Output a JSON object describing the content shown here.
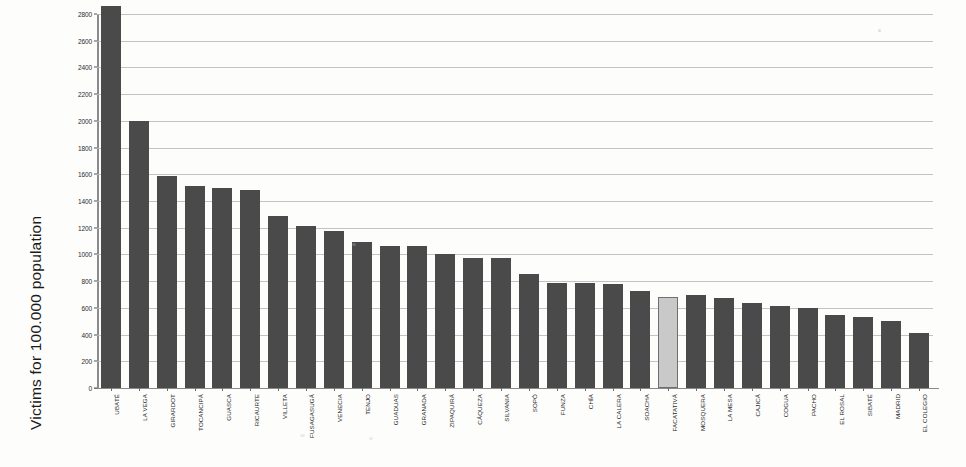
{
  "chart_data": {
    "type": "bar",
    "title": "",
    "subtitle": "",
    "xlabel": "",
    "ylabel": "Victims for 100.000 population",
    "ylim": [
      0,
      2800
    ],
    "ytick_step": 200,
    "yticks": [
      0,
      200,
      400,
      600,
      800,
      1000,
      1200,
      1400,
      1600,
      1800,
      2000,
      2200,
      2400,
      2600,
      2800
    ],
    "grid": true,
    "legend": "none",
    "orientation": "vertical",
    "bar_color": "#4a4a4a",
    "highlight_color": "#c9c9c9",
    "highlight_category": "FACATATIVÁ",
    "categories": [
      "UBATÉ",
      "LA VEGA",
      "GIRARDOT",
      "TOCANCIPÁ",
      "GUASCA",
      "RICAURTE",
      "VILLETA",
      "FUSAGASUGÁ",
      "VENECIA",
      "TENJO",
      "GUADUAS",
      "GRANADA",
      "ZIPAQUIRÁ",
      "CÁQUEZA",
      "SILVANIA",
      "SOPÓ",
      "FUNZA",
      "CHÍA",
      "LA CALERA",
      "SOACHA",
      "FACATATIVÁ",
      "MOSQUERA",
      "LA MESA",
      "CAJICÁ",
      "COGUA",
      "PACHO",
      "EL ROSAL",
      "SIBATÉ",
      "MADRID",
      "EL COLEGIO"
    ],
    "values": [
      2860,
      2000,
      1590,
      1510,
      1495,
      1480,
      1290,
      1215,
      1175,
      1095,
      1060,
      1060,
      1000,
      975,
      975,
      855,
      785,
      785,
      775,
      730,
      680,
      700,
      675,
      640,
      615,
      600,
      545,
      535,
      500,
      410
    ],
    "units": "victims per 100.000 population"
  },
  "axes": {
    "y_title": "Victims for 100.000 population"
  }
}
